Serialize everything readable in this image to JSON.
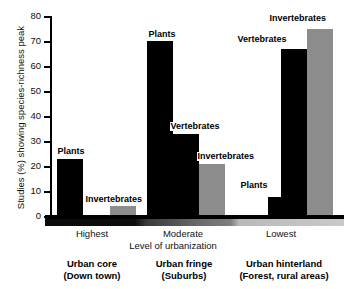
{
  "chart_data": {
    "type": "bar",
    "title": "",
    "xlabel": "Level of urbanization",
    "ylabel": "Studies (%) showing species-richness peak",
    "ylim": [
      0,
      80
    ],
    "yticks": [
      0,
      10,
      20,
      30,
      40,
      50,
      60,
      70,
      80
    ],
    "ytick_labels": [
      "0",
      "10",
      "20",
      "30",
      "40",
      "50",
      "60",
      "70",
      "80"
    ],
    "grid": false,
    "legend": "none",
    "categories": [
      "Highest",
      "Moderate",
      "Lowest"
    ],
    "category_captions": [
      {
        "line1": "Urban core",
        "line2": "(Down town)"
      },
      {
        "line1": "Urban fringe",
        "line2": "(Suburbs)"
      },
      {
        "line1": "Urban hinterland",
        "line2": "(Forest, rural areas)"
      }
    ],
    "series": [
      {
        "name": "Plants",
        "color": "#000000",
        "values": [
          23,
          70,
          7.5
        ]
      },
      {
        "name": "Vertebrates",
        "color": "#000000",
        "values": [
          null,
          33,
          67
        ]
      },
      {
        "name": "Invertebrates",
        "color": "#8c8c8c",
        "values": [
          4,
          21,
          75
        ]
      }
    ],
    "bars": [
      {
        "group": "Highest",
        "series": "Plants",
        "value": 23,
        "color": "black",
        "label": "Plants"
      },
      {
        "group": "Highest",
        "series": "Invertebrates",
        "value": 4,
        "color": "gray",
        "label": "Invertebrates"
      },
      {
        "group": "Moderate",
        "series": "Plants",
        "value": 70,
        "color": "black",
        "label": "Plants"
      },
      {
        "group": "Moderate",
        "series": "Vertebrates",
        "value": 33,
        "color": "black",
        "label": "Vertebrates"
      },
      {
        "group": "Moderate",
        "series": "Invertebrates",
        "value": 21,
        "color": "gray",
        "label": "Invertebrates"
      },
      {
        "group": "Lowest",
        "series": "Plants",
        "value": 7.5,
        "color": "black",
        "label": "Plants"
      },
      {
        "group": "Lowest",
        "series": "Vertebrates",
        "value": 67,
        "color": "black",
        "label": "Vertebrates"
      },
      {
        "group": "Lowest",
        "series": "Invertebrates",
        "value": 75,
        "color": "gray",
        "label": "Invertebrates"
      }
    ],
    "gradient_band": {
      "description": "urbanization-level gradient from dark (highest) to light (lowest)",
      "from_color": "#0a0a0a",
      "to_color": "#c9c9c9"
    }
  },
  "axis": {
    "y_title": "Studies (%) showing species-richness peak",
    "x_title": "Level of urbanization",
    "ticks": [
      {
        "value": "80"
      },
      {
        "value": "70"
      },
      {
        "value": "60"
      },
      {
        "value": "50"
      },
      {
        "value": "40"
      },
      {
        "value": "30"
      },
      {
        "value": "20"
      },
      {
        "value": "10"
      },
      {
        "value": "0"
      }
    ]
  },
  "labels": {
    "tick_highest": "Highest",
    "tick_moderate": "Moderate",
    "tick_lowest": "Lowest",
    "cap1_l1": "Urban core",
    "cap1_l2": "(Down town)",
    "cap2_l1": "Urban fringe",
    "cap2_l2": "(Suburbs)",
    "cap3_l1": "Urban hinterland",
    "cap3_l2": "(Forest, rural areas)",
    "b1_plants": "Plants",
    "b1_inverts": "Invertebrates",
    "b2_plants": "Plants",
    "b2_verts": "Vertebrates",
    "b2_inverts": "Invertebrates",
    "b3_plants": "Plants",
    "b3_verts": "Vertebrates",
    "b3_inverts": "Invertebrates"
  }
}
